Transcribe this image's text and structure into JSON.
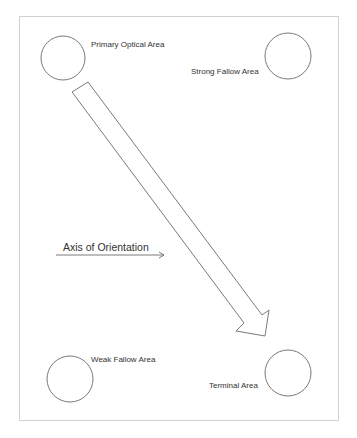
{
  "diagram": {
    "areas": [
      {
        "id": "primary-optical",
        "label": "Primary Optical Area"
      },
      {
        "id": "strong-fallow",
        "label": "Strong Fallow Area"
      },
      {
        "id": "weak-fallow",
        "label": "Weak Fallow Area"
      },
      {
        "id": "terminal",
        "label": "Terminal Area"
      }
    ],
    "axis_label": "Axis of Orientation",
    "colors": {
      "stroke": "#7a7a7a",
      "frame": "#cfcfcf",
      "text": "#333333",
      "background": "#ffffff"
    }
  }
}
